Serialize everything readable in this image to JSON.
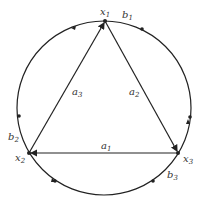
{
  "diagram": {
    "vertices": [
      {
        "id": "x1",
        "label": "x",
        "sub": "1"
      },
      {
        "id": "x2",
        "label": "x",
        "sub": "2"
      },
      {
        "id": "x3",
        "label": "x",
        "sub": "3"
      }
    ],
    "edges": [
      {
        "id": "a1",
        "label": "a",
        "sub": "1",
        "from": "x3",
        "to": "x2"
      },
      {
        "id": "a2",
        "label": "a",
        "sub": "2",
        "from": "x1",
        "to": "x3"
      },
      {
        "id": "a3",
        "label": "a",
        "sub": "3",
        "from": "x2",
        "to": "x1"
      }
    ],
    "arcs": [
      {
        "id": "b1",
        "label": "b",
        "sub": "1"
      },
      {
        "id": "b2",
        "label": "b",
        "sub": "2"
      },
      {
        "id": "b3",
        "label": "b",
        "sub": "3"
      }
    ]
  }
}
